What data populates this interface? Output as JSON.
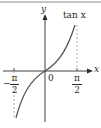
{
  "figure": {
    "function_label": "tan x",
    "axes": {
      "x_label": "x",
      "y_label": "y",
      "origin_label": "0"
    },
    "ticks": [
      {
        "sign": "−",
        "numerator": "π",
        "denominator": "2"
      },
      {
        "sign": "",
        "numerator": "π",
        "denominator": "2"
      }
    ],
    "colors": {
      "axis": "#2a2a2a",
      "curve": "#555555",
      "asymptote": "#999999",
      "border": "#888888"
    }
  }
}
